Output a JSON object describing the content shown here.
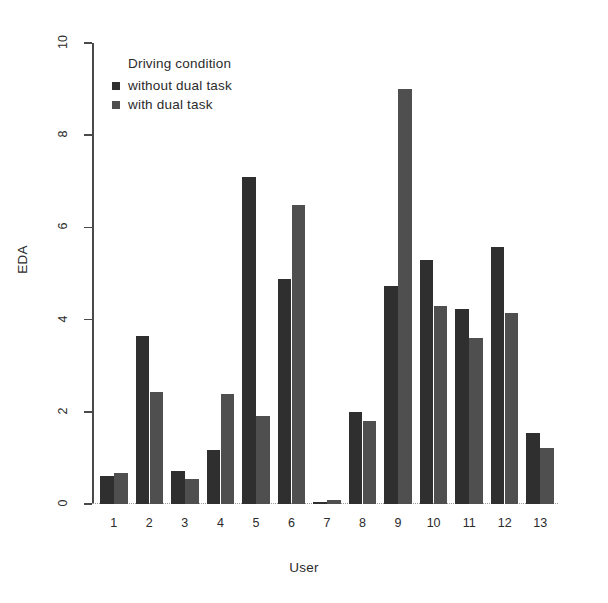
{
  "chart_data": {
    "type": "bar",
    "title": "",
    "xlabel": "User",
    "ylabel": "EDA",
    "categories": [
      "1",
      "2",
      "3",
      "4",
      "5",
      "6",
      "7",
      "8",
      "9",
      "10",
      "11",
      "12",
      "13"
    ],
    "series": [
      {
        "name": "without dual task",
        "color": "#2f2f2f",
        "values": [
          0.6,
          3.65,
          0.72,
          1.18,
          7.1,
          4.88,
          0.05,
          2.0,
          4.72,
          5.3,
          4.22,
          5.58,
          1.55
        ]
      },
      {
        "name": "with dual task",
        "color": "#4f4f4f",
        "values": [
          0.67,
          2.42,
          0.55,
          2.38,
          1.9,
          6.48,
          0.08,
          1.8,
          9.0,
          4.3,
          3.6,
          4.15,
          1.22
        ]
      }
    ],
    "ylim": [
      0,
      10
    ],
    "yticks": [
      0,
      2,
      4,
      6,
      8,
      10
    ],
    "ytick_labels": [
      "0",
      "2",
      "4",
      "6",
      "8",
      "10"
    ],
    "grid": false,
    "legend_position": "top-left",
    "legend_title": "Driving condition"
  },
  "legend": {
    "title": "Driving condition",
    "items": [
      {
        "label": "without dual task",
        "color": "#2f2f2f"
      },
      {
        "label": "with dual task",
        "color": "#4f4f4f"
      }
    ]
  },
  "axes": {
    "y_label": "EDA",
    "x_label": "User"
  }
}
